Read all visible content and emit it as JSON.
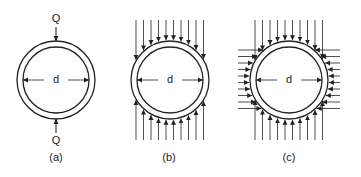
{
  "figure": {
    "stroke_color": "#222222",
    "panels": [
      {
        "id": "a",
        "caption": "(a)",
        "diameter_label": "d",
        "load_label_top": "Q",
        "load_label_bottom": "Q",
        "loading": "two opposite concentrated loads"
      },
      {
        "id": "b",
        "caption": "(b)",
        "diameter_label": "d",
        "loading": "vertical distributed loads top and bottom"
      },
      {
        "id": "c",
        "caption": "(c)",
        "diameter_label": "d",
        "loading": "vertical and horizontal distributed loads all around"
      }
    ]
  }
}
